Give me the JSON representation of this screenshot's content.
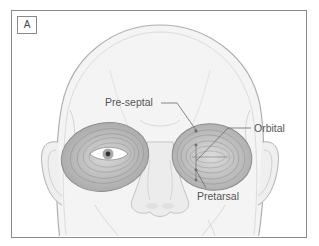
{
  "figure": {
    "panel_label": "A",
    "labels": {
      "pre_septal": "Pre-septal",
      "orbital": "Orbital",
      "pretarsal": "Pretarsal"
    },
    "colors": {
      "frame": "#8a8a8a",
      "skin_outline": "#b0b0b0",
      "muscle_fill": "#bdbdbd",
      "muscle_stroke": "#8c8c8c",
      "leader_line": "#6a6a6a",
      "text": "#555555"
    }
  }
}
